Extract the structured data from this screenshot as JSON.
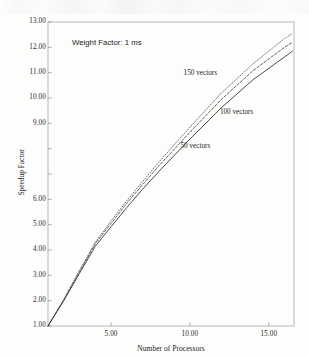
{
  "chart_data": {
    "type": "line",
    "title": "",
    "xlabel": "Number of Processors",
    "ylabel": "Speedup Factor",
    "xlim": [
      1.0,
      16.6
    ],
    "ylim": [
      1.0,
      13.0
    ],
    "grid": false,
    "legend_position": "inline-annotations",
    "x_ticks": [
      5.0,
      10.0,
      15.0
    ],
    "x_tick_labels": [
      "5.00",
      "10.00",
      "15.00"
    ],
    "y_ticks": [
      1.0,
      2.0,
      3.0,
      4.0,
      5.0,
      6.0,
      7.0,
      8.0,
      9.0,
      10.0,
      11.0,
      12.0,
      13.0
    ],
    "y_tick_labels": [
      "1.00",
      "2.00",
      "3.00",
      "4.00",
      "5.00",
      "6.00",
      "",
      "",
      "9.00",
      "10.00",
      "11.00",
      "12.00",
      "13.00"
    ],
    "annotations": [
      {
        "text": "Weight Factor: 1 ms",
        "x": 3.3,
        "y": 11.95
      },
      {
        "text": "150 vectors",
        "x": 9.6,
        "y": 10.95
      },
      {
        "text": "100 vectors",
        "x": 11.9,
        "y": 9.4
      },
      {
        "text": "50 vectors",
        "x": 9.4,
        "y": 8.05
      }
    ],
    "x": [
      1.0,
      2.0,
      3.0,
      4.0,
      5.0,
      6.0,
      7.0,
      8.0,
      10.0,
      12.0,
      14.0,
      16.0,
      16.5
    ],
    "series": [
      {
        "name": "150 vectors",
        "label": "150 vectors",
        "style": "dotted",
        "color": "#4d4d4d",
        "values": [
          1.0,
          2.05,
          3.2,
          4.3,
          5.15,
          5.95,
          6.7,
          7.45,
          8.85,
          10.2,
          11.35,
          12.35,
          12.55
        ]
      },
      {
        "name": "100 vectors",
        "label": "100 vectors",
        "style": "dashed",
        "color": "#3d3d3d",
        "values": [
          1.0,
          2.03,
          3.15,
          4.25,
          5.05,
          5.85,
          6.58,
          7.3,
          8.65,
          9.95,
          11.08,
          12.0,
          12.2
        ]
      },
      {
        "name": "50 vectors",
        "label": "50 vectors",
        "style": "solid",
        "color": "#2b2b2b",
        "values": [
          1.0,
          2.0,
          3.08,
          4.15,
          4.92,
          5.68,
          6.4,
          7.08,
          8.38,
          9.62,
          10.72,
          11.62,
          11.85
        ]
      }
    ]
  },
  "axis": {
    "x_title": "Number of Processors",
    "y_title": "Speedup Factor"
  },
  "notes": {
    "weight_factor": "Weight Factor: 1 ms",
    "series_150": "150 vectors",
    "series_100": "100 vectors",
    "series_50": "50 vectors"
  }
}
